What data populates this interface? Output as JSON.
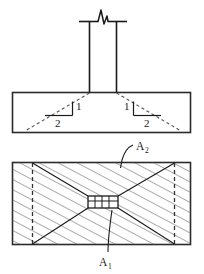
{
  "figure": {
    "type": "structural-engineering-detail",
    "views": [
      {
        "name": "elevation-view",
        "elements": [
          "column",
          "column-break-symbol",
          "footing",
          "load-spread-line-left",
          "load-spread-line-right",
          "slope-triangle-left",
          "slope-triangle-right"
        ]
      },
      {
        "name": "plan-view",
        "elements": [
          "footing-outline",
          "spread-area-dashed-boundary",
          "hatched-area",
          "column-footprint",
          "corner-diagonals"
        ]
      }
    ]
  },
  "labels": {
    "slope_rise_left": "1",
    "slope_run_left": "2",
    "slope_rise_right": "1",
    "slope_run_right": "2",
    "area_supporting": "A",
    "area_supporting_sub": "2",
    "area_loaded": "A",
    "area_loaded_sub": "1"
  },
  "colors": {
    "line": "#1a1a1a",
    "outline": "#2b2b2b",
    "dashed": "#555555",
    "hatch": "#6b6b6b",
    "background": "#ffffff"
  },
  "geometry": {
    "canvas": {
      "width": 204,
      "height": 274
    },
    "column": {
      "x": 89,
      "y": 20,
      "width": 28,
      "height": 72
    },
    "footing_elevation": {
      "x": 12,
      "y": 92,
      "width": 179,
      "height": 41
    },
    "footing_plan": {
      "x": 12,
      "y": 162,
      "width": 179,
      "height": 83
    },
    "spread_boundary_plan": {
      "x": 32,
      "y": 162,
      "width": 143,
      "height": 83
    },
    "column_footprint_plan": {
      "x": 88,
      "y": 196,
      "width": 30,
      "height": 12
    },
    "slope_ratio": "1:2"
  }
}
